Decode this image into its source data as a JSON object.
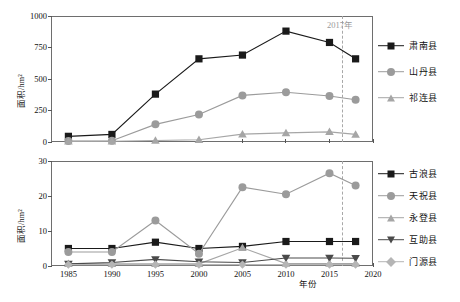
{
  "figure": {
    "caption": "",
    "annotation_top": "2017年",
    "annotation_bottom": "",
    "axis_x_label": "年份",
    "axis_y_label": "面积/hm²"
  },
  "chart_data": [
    {
      "type": "line",
      "panel": "top",
      "title": "",
      "xlabel": "",
      "ylabel": "面积/hm²",
      "xlim": [
        1983,
        2020
      ],
      "ylim": [
        0,
        1000
      ],
      "yticks": [
        0,
        250,
        500,
        750,
        1000
      ],
      "xticks": [
        1985,
        1990,
        1995,
        2000,
        2005,
        2010,
        2015,
        2020
      ],
      "xticklabels": [
        "",
        "",
        "",
        "",
        "",
        "",
        "",
        ""
      ],
      "grid": false,
      "legend_position": "right",
      "x": [
        1985,
        1990,
        1995,
        2000,
        2005,
        2010,
        2015,
        2018
      ],
      "series": [
        {
          "name": "肃南县",
          "marker": "square",
          "color": "#1a1a1a",
          "values": [
            45,
            60,
            380,
            660,
            690,
            880,
            790,
            660
          ]
        },
        {
          "name": "山丹县",
          "marker": "circle",
          "color": "#9b9b9b",
          "values": [
            8,
            10,
            140,
            218,
            370,
            395,
            365,
            335
          ]
        },
        {
          "name": "祁连县",
          "marker": "triangle",
          "color": "#a6a6a6",
          "values": [
            5,
            6,
            12,
            18,
            62,
            72,
            80,
            60
          ]
        }
      ]
    },
    {
      "type": "line",
      "panel": "bottom",
      "title": "",
      "xlabel": "年份",
      "ylabel": "面积/hm²",
      "xlim": [
        1983,
        2020
      ],
      "ylim": [
        0,
        30
      ],
      "yticks": [
        0,
        10,
        20,
        30
      ],
      "xticks": [
        1985,
        1990,
        1995,
        2000,
        2005,
        2010,
        2015,
        2020
      ],
      "xticklabels": [
        "1985",
        "1990",
        "1995",
        "2000",
        "2005",
        "2010",
        "2015",
        "2020"
      ],
      "grid": false,
      "legend_position": "right",
      "x": [
        1985,
        1990,
        1995,
        2000,
        2005,
        2010,
        2015,
        2018
      ],
      "series": [
        {
          "name": "古浪县",
          "marker": "square",
          "color": "#1a1a1a",
          "values": [
            5.0,
            5.0,
            6.8,
            5.0,
            5.6,
            7.0,
            7.0,
            7.0
          ]
        },
        {
          "name": "天祝县",
          "marker": "circle",
          "color": "#9b9b9b",
          "values": [
            4.0,
            4.0,
            13.0,
            3.5,
            22.5,
            20.5,
            26.5,
            23.0
          ]
        },
        {
          "name": "永登县",
          "marker": "triangle",
          "color": "#a6a6a6",
          "values": [
            0.6,
            0.6,
            0.6,
            0.6,
            5.2,
            0.7,
            0.7,
            0.7
          ]
        },
        {
          "name": "互助县",
          "marker": "triangle-down",
          "color": "#4a4a4a",
          "values": [
            0.6,
            1.0,
            1.9,
            1.2,
            1.0,
            2.3,
            2.3,
            2.2
          ]
        },
        {
          "name": "门源县",
          "marker": "diamond",
          "color": "#b5b5b5",
          "values": [
            0.4,
            0.4,
            0.4,
            0.4,
            0.4,
            0.4,
            0.4,
            0.4
          ]
        }
      ]
    }
  ],
  "legend_top": {
    "items": [
      {
        "label": "肃南县",
        "marker": "square",
        "color": "#1a1a1a"
      },
      {
        "label": "山丹县",
        "marker": "circle",
        "color": "#9b9b9b"
      },
      {
        "label": "祁连县",
        "marker": "triangle",
        "color": "#a6a6a6"
      }
    ]
  },
  "legend_bottom": {
    "items": [
      {
        "label": "古浪县",
        "marker": "square",
        "color": "#1a1a1a"
      },
      {
        "label": "天祝县",
        "marker": "circle",
        "color": "#9b9b9b"
      },
      {
        "label": "永登县",
        "marker": "triangle",
        "color": "#a6a6a6"
      },
      {
        "label": "互助县",
        "marker": "triangle-down",
        "color": "#4a4a4a"
      },
      {
        "label": "门源县",
        "marker": "diamond",
        "color": "#b5b5b5"
      }
    ]
  },
  "ytick_labels_top": [
    "1000",
    "750",
    "500",
    "250",
    "0"
  ],
  "ytick_labels_bottom": [
    "30",
    "20",
    "10",
    "0"
  ],
  "xtick_labels_bottom": [
    "1985",
    "1990",
    "1995",
    "2000",
    "2005",
    "2010",
    "2015",
    "2020"
  ]
}
